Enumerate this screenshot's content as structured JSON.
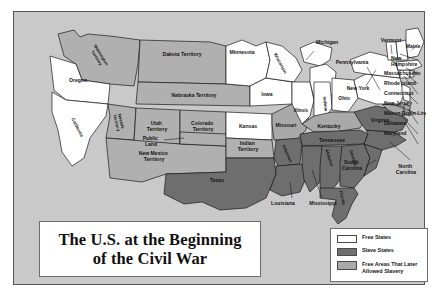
{
  "figure": {
    "title_line1": "The U.S. at the Beginning",
    "title_line2": "of the Civil War"
  },
  "colors": {
    "panel_background": "#c9c9c9",
    "free_state": "#ffffff",
    "slave_state": "#6e6e6e",
    "later_allowed_slavery": "#a9a9a9",
    "territory": "#b0b0b0",
    "outline": "#1a1a1a",
    "panel_border": "#58585a"
  },
  "legend": {
    "items": [
      {
        "label": "Free States",
        "swatch": "#ffffff"
      },
      {
        "label": "Slave States",
        "swatch": "#6e6e6e"
      },
      {
        "label": "Free Areas That Later\nAllowed Slavery",
        "swatch": "#a9a9a9"
      }
    ],
    "item0_label": "Free States",
    "item1_label": "Slave States",
    "item2_label_line1": "Free Areas That Later",
    "item2_label_line2": "Allowed Slavery"
  },
  "map": {
    "regions": [
      {
        "name": "Washington Territory",
        "label": "Washington Territory",
        "category": "territory",
        "rotated": true
      },
      {
        "name": "Oregon",
        "label": "Oregon",
        "category": "free"
      },
      {
        "name": "California",
        "label": "California",
        "category": "free",
        "rotated": true
      },
      {
        "name": "Nevada Territory",
        "label": "Nevada Territory",
        "category": "territory",
        "rotated": true
      },
      {
        "name": "Utah Territory",
        "label": "Utah Territory",
        "category": "territory"
      },
      {
        "name": "Colorado Territory",
        "label": "Colorado Territory",
        "category": "territory"
      },
      {
        "name": "New Mexico Territory",
        "label": "New Mexico Territory",
        "category": "territory"
      },
      {
        "name": "Public Land",
        "label": "Public Land",
        "category": "territory"
      },
      {
        "name": "Dakota Territory",
        "label": "Dakota Territory",
        "category": "territory"
      },
      {
        "name": "Nebraska Territory",
        "label": "Nebraska Territory",
        "category": "territory"
      },
      {
        "name": "Kansas",
        "label": "Kansas",
        "category": "free"
      },
      {
        "name": "Indian Territory",
        "label": "Indian Territory",
        "category": "territory"
      },
      {
        "name": "Texas",
        "label": "Texas",
        "category": "slave"
      },
      {
        "name": "Minnesota",
        "label": "Minnesota",
        "category": "free"
      },
      {
        "name": "Iowa",
        "label": "Iowa",
        "category": "free"
      },
      {
        "name": "Missouri",
        "label": "Missouri",
        "category": "later"
      },
      {
        "name": "Wisconsin",
        "label": "Wisconsin",
        "category": "free",
        "rotated": true
      },
      {
        "name": "Illinois",
        "label": "Illinois",
        "category": "free"
      },
      {
        "name": "Michigan",
        "label": "Michigan",
        "category": "free"
      },
      {
        "name": "Indiana",
        "label": "Indiana",
        "category": "free",
        "rotated": true
      },
      {
        "name": "Ohio",
        "label": "Ohio",
        "category": "free"
      },
      {
        "name": "Kentucky",
        "label": "Kentucky",
        "category": "later"
      },
      {
        "name": "Tennessee",
        "label": "Tennessee",
        "category": "slave"
      },
      {
        "name": "Arkansas",
        "label": "Arkansas",
        "category": "slave",
        "rotated": true
      },
      {
        "name": "Louisiana",
        "label": "Louisiana",
        "category": "slave"
      },
      {
        "name": "Mississippi",
        "label": "Mississippi",
        "category": "slave"
      },
      {
        "name": "Alabama",
        "label": "Alabama",
        "category": "slave",
        "rotated": true
      },
      {
        "name": "Georgia",
        "label": "Georgia",
        "category": "slave",
        "rotated": true
      },
      {
        "name": "Florida",
        "label": "Florida",
        "category": "slave",
        "rotated": true
      },
      {
        "name": "South Carolina",
        "label": "South Carolina",
        "category": "slave"
      },
      {
        "name": "North Carolina",
        "label": "North Carolina",
        "category": "slave"
      },
      {
        "name": "Virginia",
        "label": "Virginia",
        "category": "slave"
      },
      {
        "name": "Maryland",
        "label": "Maryland",
        "category": "later"
      },
      {
        "name": "Delaware",
        "label": "Delaware",
        "category": "later"
      },
      {
        "name": "Pennsylvania",
        "label": "Pennsylvania",
        "category": "free"
      },
      {
        "name": "New York",
        "label": "New York",
        "category": "free"
      },
      {
        "name": "New Jersey",
        "label": "New Jersey",
        "category": "free"
      },
      {
        "name": "Connecticut",
        "label": "Connecticut",
        "category": "free"
      },
      {
        "name": "Rhode Island",
        "label": "Rhode Island",
        "category": "free"
      },
      {
        "name": "Massachusetts",
        "label": "Massachusetts",
        "category": "free"
      },
      {
        "name": "Vermont",
        "label": "Vermont",
        "category": "free"
      },
      {
        "name": "New Hampshire",
        "label": "New Hampshire",
        "category": "free"
      },
      {
        "name": "Maine",
        "label": "Maine",
        "category": "free"
      }
    ],
    "annotations": [
      {
        "name": "Mason-Dixon Line",
        "label": "Mason-Dixon Line"
      }
    ],
    "labels": {
      "washington_territory_l1": "Washington",
      "washington_territory_l2": "Territory",
      "oregon": "Oregon",
      "california": "California",
      "nevada_l1": "Nevada",
      "nevada_l2": "Territory",
      "utah_l1": "Utah",
      "utah_l2": "Territory",
      "colorado_l1": "Colorado",
      "colorado_l2": "Territory",
      "newmexico_l1": "New Mexico",
      "newmexico_l2": "Territory",
      "public_l1": "Public",
      "public_l2": "Land",
      "dakota": "Dakota Territory",
      "nebraska": "Nebraska Territory",
      "kansas": "Kansas",
      "indian_l1": "Indian",
      "indian_l2": "Territory",
      "texas": "Texas",
      "minnesota": "Minnesota",
      "iowa": "Iowa",
      "missouri": "Missouri",
      "wisconsin": "Wisconsin",
      "illinois": "Illinois",
      "michigan": "Michigan",
      "indiana": "Indiana",
      "ohio": "Ohio",
      "kentucky": "Kentucky",
      "tennessee": "Tennessee",
      "arkansas": "Arkansas",
      "louisiana": "Louisiana",
      "mississippi": "Mississippi",
      "alabama": "Alabama",
      "georgia": "Georgia",
      "florida": "Florida",
      "south_carolina_l1": "South",
      "south_carolina_l2": "Carolina",
      "north_carolina_l1": "North",
      "north_carolina_l2": "Carolina",
      "virginia": "Virginia",
      "pennsylvania": "Pennsylvania",
      "new_york": "New York",
      "vermont": "Vermont",
      "maine": "Maine",
      "new_hampshire_l1": "New",
      "new_hampshire_l2": "Hampshire",
      "massachusetts": "Massachusetts",
      "rhode_island": "Rhode Island",
      "connecticut": "Connecticut",
      "new_jersey": "New Jersey",
      "mason_dixon": "Mason-Dixon Line",
      "delaware": "Delaware",
      "maryland": "Maryland"
    }
  }
}
